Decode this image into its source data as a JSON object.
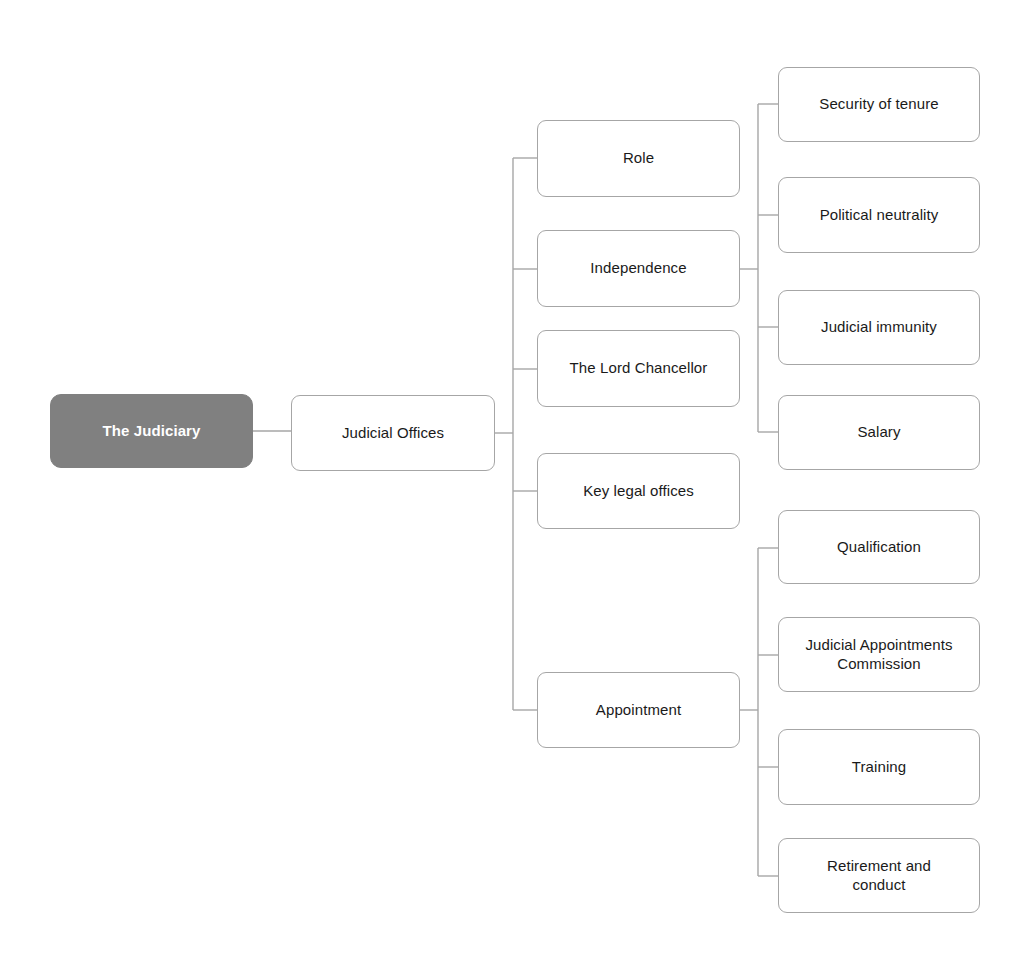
{
  "diagram": {
    "title": "The Judiciary",
    "type": "mind-map",
    "palette": {
      "root_fill": "#808080",
      "root_text": "#ffffff",
      "node_fill": "#ffffff",
      "node_border": "#a6a6a6",
      "node_text": "#1a1a1a",
      "connector": "#a6a6a6",
      "background": "#ffffff"
    },
    "nodes": {
      "root": {
        "label": "The Judiciary"
      },
      "level1": {
        "label": "Judicial Offices"
      },
      "level2": [
        {
          "label": "Role"
        },
        {
          "label": "Independence"
        },
        {
          "label": "The Lord Chancellor"
        },
        {
          "label": "Key legal offices"
        },
        {
          "label": "Appointment"
        }
      ],
      "independence_children": [
        {
          "label": "Security of tenure"
        },
        {
          "label": "Political neutrality"
        },
        {
          "label": "Judicial immunity"
        },
        {
          "label": "Salary"
        }
      ],
      "appointment_children": [
        {
          "label": "Qualification"
        },
        {
          "label": "Judicial Appointments\nCommission"
        },
        {
          "label": "Training"
        },
        {
          "label": "Retirement and\nconduct"
        }
      ]
    }
  }
}
